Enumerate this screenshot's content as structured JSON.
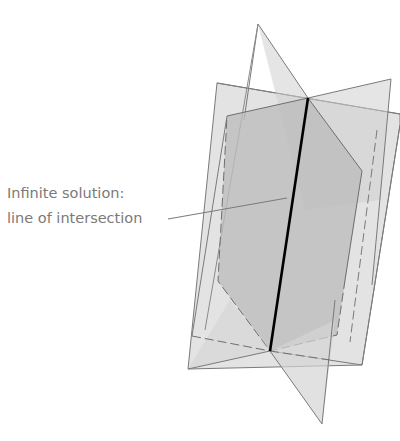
{
  "figure": {
    "annotation": {
      "line1": "Infinite solution:",
      "line2": "line of intersection"
    },
    "planes": [
      {
        "name": "plane-triangles",
        "description": "plane seen edge-on as two triangles meeting at intersection line"
      },
      {
        "name": "plane-rectangle",
        "description": "tilted rectangular plane"
      },
      {
        "name": "plane-hexagon",
        "description": "hexagonal plane with dashed hidden edges"
      }
    ],
    "colors": {
      "plane_fill_light": "#d6d6d6",
      "plane_fill_mid": "#c4c4c4",
      "plane_fill_dark": "#b4b4b4",
      "edge": "#6e6e6e",
      "intersection_line": "#000000",
      "label_text": "#7a7a7a"
    }
  }
}
